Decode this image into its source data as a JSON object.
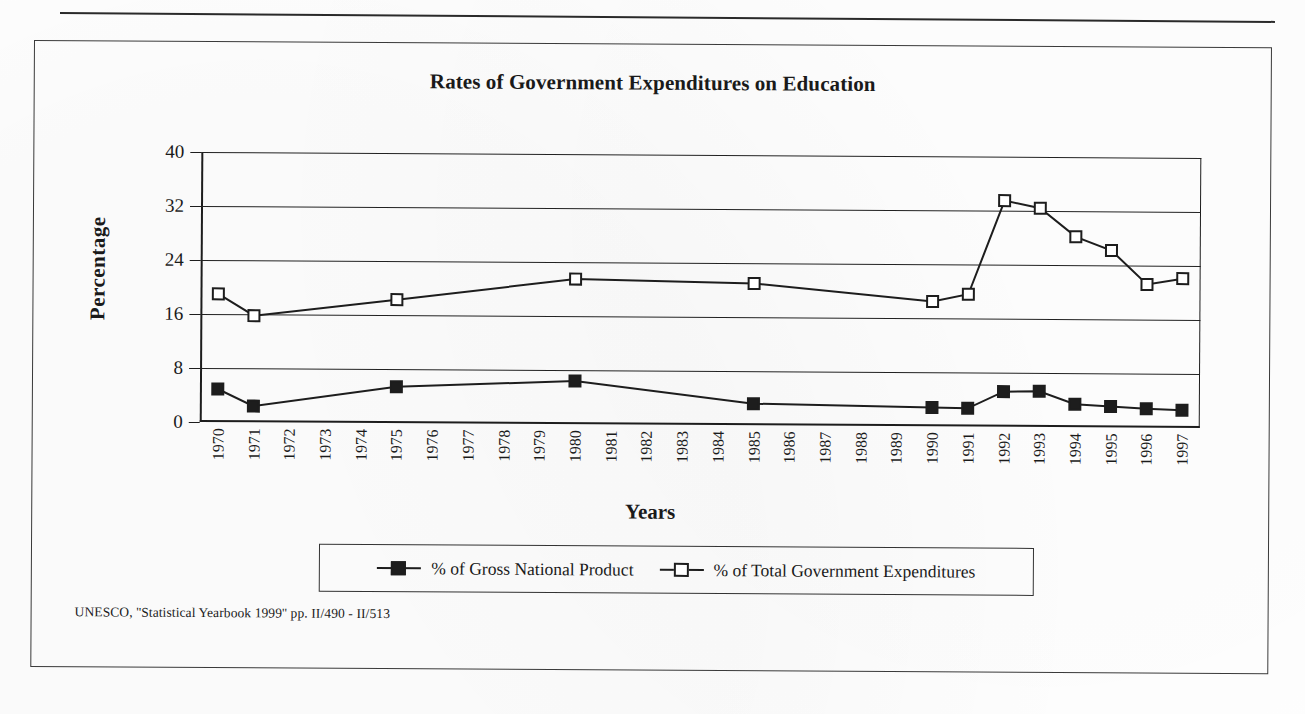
{
  "document": {
    "source_note": "UNESCO, ''Statistical Yearbook 1999'' pp. II/490 - II/513"
  },
  "legend": {
    "items": [
      {
        "label": "% of Gross National Product",
        "marker": "filled-square",
        "color": "#1d1d1d"
      },
      {
        "label": "% of Total Government Expenditures",
        "marker": "open-square",
        "color": "#1d1d1d"
      }
    ]
  },
  "chart_data": {
    "type": "line",
    "title": "Rates of Government Expenditures on Education",
    "xlabel": "Years",
    "ylabel": "Percentage",
    "ylim": [
      0,
      40
    ],
    "yticks": [
      0,
      8,
      16,
      24,
      32,
      40
    ],
    "grid": true,
    "legend_position": "bottom",
    "categories": [
      "1970",
      "1971",
      "1972",
      "1973",
      "1974",
      "1975",
      "1976",
      "1977",
      "1978",
      "1979",
      "1980",
      "1981",
      "1982",
      "1983",
      "1984",
      "1985",
      "1986",
      "1987",
      "1988",
      "1989",
      "1990",
      "1991",
      "1992",
      "1993",
      "1994",
      "1995",
      "1996",
      "1997"
    ],
    "series": [
      {
        "name": "% of Gross National Product",
        "marker": "filled-square",
        "values": [
          4.9,
          2.4,
          null,
          null,
          null,
          5.4,
          null,
          null,
          null,
          null,
          6.4,
          null,
          null,
          null,
          null,
          3.2,
          null,
          null,
          null,
          null,
          2.8,
          2.7,
          5.2,
          5.3,
          3.4,
          3.1,
          2.8,
          2.6
        ]
      },
      {
        "name": "% of Total Government Expenditures",
        "marker": "open-square",
        "values": [
          19.0,
          15.8,
          null,
          null,
          null,
          18.3,
          null,
          null,
          null,
          null,
          21.5,
          null,
          null,
          null,
          null,
          21.0,
          null,
          null,
          null,
          null,
          18.5,
          19.6,
          33.5,
          32.4,
          28.2,
          26.2,
          21.2,
          22.1
        ]
      }
    ]
  }
}
